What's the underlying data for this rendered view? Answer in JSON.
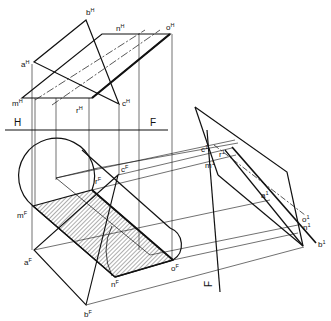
{
  "figure": {
    "title": "",
    "views": [
      "top (H)",
      "front (F)",
      "auxiliary (1)"
    ],
    "fold_lines": [
      {
        "label_left": "H",
        "label_right": "F"
      },
      {
        "label": "F"
      }
    ],
    "top_view_labels": {
      "b": {
        "base": "b",
        "sup": "H"
      },
      "n": {
        "base": "n",
        "sup": "H"
      },
      "o": {
        "base": "o",
        "sup": "H"
      },
      "a": {
        "base": "a",
        "sup": "H"
      },
      "m": {
        "base": "m",
        "sup": "H"
      },
      "r": {
        "base": "r",
        "sup": "H"
      },
      "c": {
        "base": "c",
        "sup": "H"
      }
    },
    "front_view_labels": {
      "r": {
        "base": "r",
        "sup": "F"
      },
      "c": {
        "base": "c",
        "sup": "F"
      },
      "m": {
        "base": "m",
        "sup": "F"
      },
      "a": {
        "base": "a",
        "sup": "F"
      },
      "n": {
        "base": "n",
        "sup": "F"
      },
      "o": {
        "base": "o",
        "sup": "F"
      },
      "b": {
        "base": "b",
        "sup": "F"
      }
    },
    "aux_view_labels": {
      "c": {
        "base": "c",
        "sup": "1"
      },
      "r": {
        "base": "r",
        "sup": "1"
      },
      "m": {
        "base": "m",
        "sup": "1"
      },
      "a": {
        "base": "a",
        "sup": "1"
      },
      "o": {
        "base": "o",
        "sup": "1"
      },
      "n": {
        "base": "n",
        "sup": "1"
      },
      "b": {
        "base": "b",
        "sup": "1"
      }
    },
    "fold_H_left": "H",
    "fold_H_right": "F",
    "fold_aux_label": "F",
    "colors": {
      "ink": "#111111",
      "background": "#ffffff",
      "hatch": "#333333"
    }
  }
}
